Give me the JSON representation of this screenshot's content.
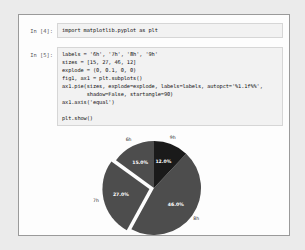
{
  "page": {
    "watermark_text": "CSDN @ITEN"
  },
  "notebook": {
    "cells": [
      {
        "prompt": "In [4]:",
        "lines": [
          "import matplotlib.pyplot as plt"
        ]
      },
      {
        "prompt": "In [5]:",
        "lines": [
          "labels = '6h', '7h', '8h', '9h'",
          "sizes = [15, 27, 46, 12]",
          "explode = (0, 0.1, 0, 0)",
          "fig1, ax1 = plt.subplots()",
          "ax1.pie(sizes, explode=explode, labels=labels, autopct='%1.1f%%',",
          "        shadow=False, startangle=90)",
          "ax1.axis('equal')",
          "",
          "plt.show()"
        ]
      }
    ]
  },
  "chart_data": {
    "type": "pie",
    "title": "",
    "categories": [
      "6h",
      "7h",
      "8h",
      "9h"
    ],
    "values": [
      15,
      27,
      46,
      12
    ],
    "percent_labels": [
      "15.0%",
      "27.0%",
      "46.0%",
      "12.0%"
    ],
    "explode": [
      0,
      0.1,
      0,
      0
    ],
    "startangle": 90,
    "shadow": false,
    "autopct": "%1.1f%%",
    "colors": [
      "#4d4d4d",
      "#4d4d4d",
      "#4d4d4d",
      "#1a1a1a"
    ],
    "legend": "none",
    "grid": false
  }
}
